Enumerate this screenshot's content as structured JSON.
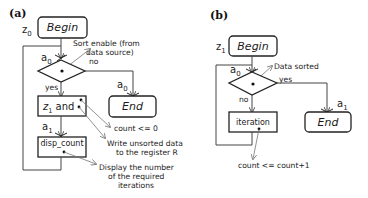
{
  "panels": {
    "a": {
      "label": "(a)",
      "begin_state": "z",
      "begin_state_sub": "0",
      "begin_label": "Begin",
      "end_label": "End",
      "decision_in_signal": "a",
      "decision_in_signal_sub": "0",
      "decision_condition_line1": "Sort enable (from",
      "decision_condition_line2": "data source)",
      "branch_no": "no",
      "branch_yes": "yes",
      "end_in_signal": "a",
      "end_in_signal_sub": "0",
      "state_box_var": "z",
      "state_box_var_sub": "1",
      "state_box_suffix": " and",
      "action1": "count <= 0",
      "action2_line1": "Write unsorted data",
      "action2_line2": "to the register R",
      "disp_in_signal": "a",
      "disp_in_signal_sub": "1",
      "disp_box_label": "disp_count",
      "disp_action_line1": "Display the number",
      "disp_action_line2": "of the required",
      "disp_action_line3": "iterations"
    },
    "b": {
      "label": "(b)",
      "begin_state": "z",
      "begin_state_sub": "1",
      "begin_label": "Begin",
      "end_label": "End",
      "decision_in_signal": "a",
      "decision_in_signal_sub": "0",
      "decision_condition": "Data sorted",
      "branch_yes": "yes",
      "branch_no": "no",
      "end_in_signal": "a",
      "end_in_signal_sub": "1",
      "iteration_box_label": "iteration",
      "iteration_action": "count <= count+1"
    }
  },
  "colors": {
    "stroke": "#222222",
    "edge": "#444444",
    "pointer": "#777777",
    "background": "#ffffff"
  }
}
